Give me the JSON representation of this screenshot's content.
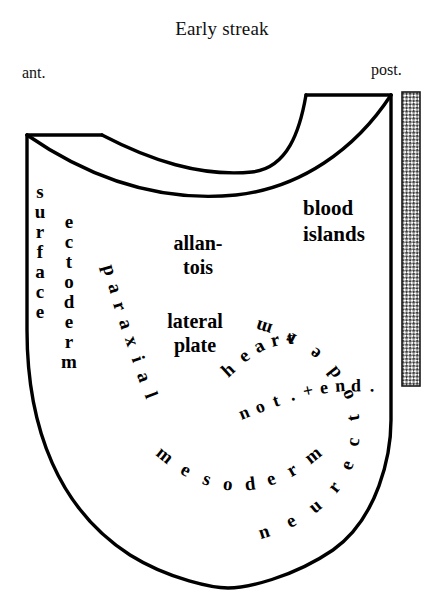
{
  "figure": {
    "title": "Early streak",
    "orientation": {
      "anterior_label": "ant.",
      "posterior_label": "post."
    },
    "colors": {
      "ink": "#000000",
      "background": "#ffffff",
      "hatch": "#4a4a4a"
    }
  },
  "labels": {
    "blood_islands": {
      "line1": "blood",
      "line2": "islands"
    },
    "allantois": {
      "line1": "allan-",
      "line2": "tois"
    },
    "lateral_plate": {
      "line1": "lateral",
      "line2": "plate"
    },
    "surface": "surface",
    "ectoderm": "ectoderm",
    "paraxial": "paraxial",
    "heart": "heart",
    "notochord_endoderm": "not.+end.",
    "mesoderm": "mesoderm",
    "neurectoderm": "neurectoderm"
  },
  "regions": [
    "surface ectoderm",
    "ectoderm",
    "paraxial",
    "allantois",
    "lateral plate",
    "heart",
    "blood islands",
    "not.+end.",
    "mesoderm",
    "neurectoderm"
  ],
  "marks": {
    "primitive_streak_bar": "hatched-vertical-bar"
  }
}
